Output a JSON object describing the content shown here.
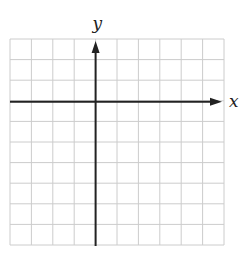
{
  "figure": {
    "type": "coordinate-grid",
    "grid": {
      "columns": 10,
      "rows": 10,
      "left": 10,
      "top": 39,
      "right": 224,
      "bottom": 245,
      "line_color": "#cccccc"
    },
    "axes": {
      "color": "#222222",
      "x_axis_row": 3,
      "y_axis_column": 4,
      "x_label": "x",
      "y_label": "y"
    }
  },
  "chart_data": {
    "type": "scatter",
    "title": "",
    "xlabel": "x",
    "ylabel": "y",
    "grid": true,
    "xlim": [
      -4,
      6
    ],
    "ylim": [
      -7,
      3
    ],
    "series": []
  }
}
